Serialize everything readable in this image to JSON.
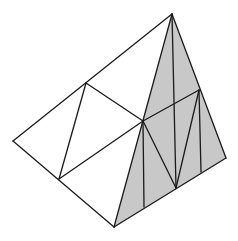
{
  "diagram": {
    "type": "geometric-solid",
    "colors": {
      "background": "#ffffff",
      "stroke": "#1a1a1a",
      "shade": "#c8c8c8"
    },
    "vertices": {
      "apex": [
        172,
        14
      ],
      "left": [
        13,
        141
      ],
      "bottom": [
        114,
        227
      ],
      "right": [
        226,
        158
      ],
      "top_left_mid": [
        86,
        83
      ],
      "left_bottom_mid": [
        59,
        179
      ],
      "center": [
        143,
        121
      ],
      "right_mid": [
        199,
        90
      ],
      "bottom_v": [
        176,
        188
      ],
      "bottom_vertical_1": [
        144,
        207
      ],
      "bottom_vertical_2": [
        201,
        172
      ]
    }
  }
}
